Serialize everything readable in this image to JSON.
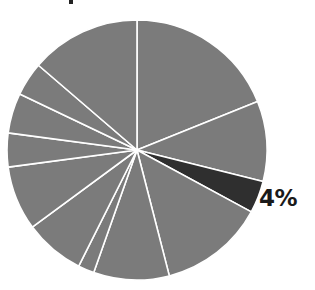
{
  "chart_data": {
    "type": "pie",
    "title": "",
    "start_angle_deg": 0,
    "direction": "clockwise",
    "slices": [
      {
        "label": "",
        "percent": 18.9,
        "color": "#7b7b7b"
      },
      {
        "label": "",
        "percent": 10.0,
        "color": "#7b7b7b"
      },
      {
        "label": "4%",
        "percent": 4.0,
        "color": "#2f2f2f",
        "highlighted": true
      },
      {
        "label": "",
        "percent": 13.1,
        "color": "#7b7b7b"
      },
      {
        "label": "",
        "percent": 9.4,
        "color": "#7b7b7b"
      },
      {
        "label": "",
        "percent": 2.0,
        "color": "#7b7b7b"
      },
      {
        "label": "",
        "percent": 7.5,
        "color": "#7b7b7b"
      },
      {
        "label": "",
        "percent": 8.0,
        "color": "#7b7b7b"
      },
      {
        "label": "",
        "percent": 4.2,
        "color": "#7b7b7b"
      },
      {
        "label": "",
        "percent": 5.0,
        "color": "#7b7b7b"
      },
      {
        "label": "",
        "percent": 4.2,
        "color": "#7b7b7b"
      },
      {
        "label": "",
        "percent": 13.7,
        "color": "#7b7b7b"
      }
    ],
    "annotations": [
      {
        "text": "4%",
        "slice_index": 2
      }
    ],
    "legend": null
  },
  "labels": {
    "highlight_pct": "4%"
  },
  "colors": {
    "slice_default": "#7b7b7b",
    "slice_highlight": "#2f2f2f",
    "separator": "#ffffff",
    "label": "#1a1a1a"
  }
}
